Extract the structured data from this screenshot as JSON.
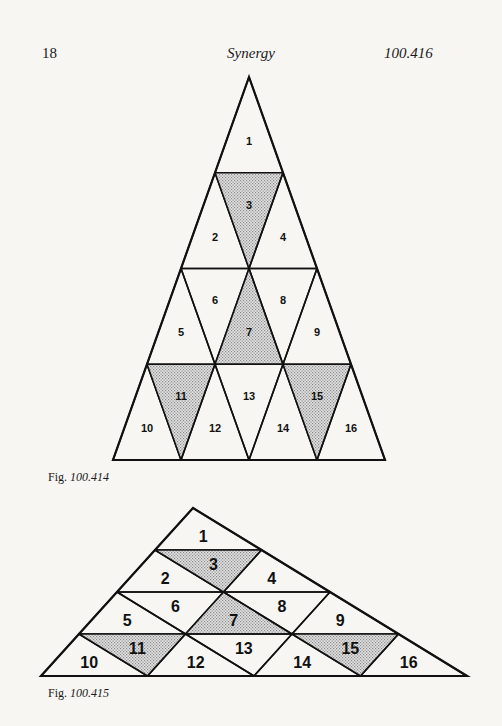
{
  "header": {
    "page_number": "18",
    "title": "Synergy",
    "section": "100.416"
  },
  "colors": {
    "background": "#f7f6f3",
    "line": "#111111",
    "shade": "#cdcdcd"
  },
  "figures": [
    {
      "id": "fig1",
      "caption_prefix": "Fig.",
      "caption_number": "100.414",
      "rows": 4,
      "origin": [
        249,
        77
      ],
      "row_dx": -34,
      "col_dx": 68,
      "row_dy": 95.75,
      "font_size": 11,
      "shaded": [
        3,
        7,
        11,
        15
      ],
      "labels": [
        "1",
        "2",
        "3",
        "4",
        "5",
        "6",
        "7",
        "8",
        "9",
        "10",
        "11",
        "12",
        "13",
        "14",
        "15",
        "16"
      ]
    },
    {
      "id": "fig2",
      "caption_prefix": "Fig.",
      "caption_number": "100.415",
      "rows": 4,
      "origin": [
        193,
        508
      ],
      "row_dx": -38,
      "col_dx": 106.5,
      "row_dy": 42,
      "font_size": 16,
      "shaded": [
        3,
        7,
        11,
        15
      ],
      "labels": [
        "1",
        "2",
        "3",
        "4",
        "5",
        "6",
        "7",
        "8",
        "9",
        "10",
        "11",
        "12",
        "13",
        "14",
        "15",
        "16"
      ]
    }
  ]
}
